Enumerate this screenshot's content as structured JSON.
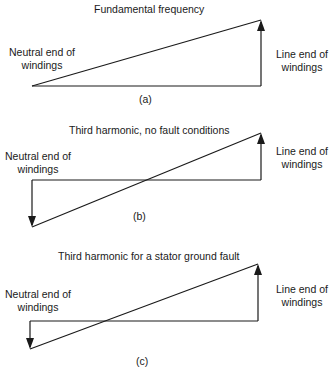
{
  "panels": [
    {
      "id": "a",
      "title": "Fundamental frequency",
      "caption": "(a)",
      "left_label": [
        "Neutral end of",
        "windings"
      ],
      "right_label": [
        "Line end of",
        "windings"
      ]
    },
    {
      "id": "b",
      "title": "Third harmonic, no fault conditions",
      "caption": "(b)",
      "left_label": [
        "Neutral end of",
        "windings"
      ],
      "right_label": [
        "Line end of",
        "windings"
      ]
    },
    {
      "id": "c",
      "title": "Third harmonic for a stator ground fault",
      "caption": "(c)",
      "left_label": [
        "Neutral end of",
        "windings"
      ],
      "right_label": [
        "Line end of",
        "windings"
      ]
    }
  ],
  "colors": {
    "line": "#1a1a1a",
    "background": "#ffffff"
  }
}
